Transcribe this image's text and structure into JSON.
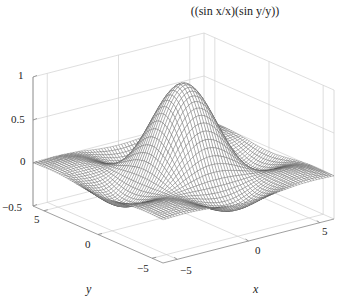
{
  "chart_data": {
    "type": "surface3d",
    "title": "((sin x/x)(sin y/y))",
    "function": "z = (sin x / x) * (sin y / y)",
    "xlabel": "x",
    "ylabel": "y",
    "zlabel": "",
    "xlim": [
      -6,
      6
    ],
    "ylim": [
      -6,
      6
    ],
    "zlim": [
      -0.5,
      1
    ],
    "x_ticks": [
      "-5",
      "0",
      "5"
    ],
    "y_ticks": [
      "5",
      "0",
      "-5"
    ],
    "z_ticks": [
      "1",
      "0.5",
      "0",
      "-0.5"
    ],
    "grid": true,
    "style": "mesh",
    "peak": {
      "x": 0,
      "y": 0,
      "z": 1
    },
    "colors": {
      "mesh": "#555555",
      "grid": "#d0d0d0",
      "axis": "#888888"
    }
  },
  "labels": {
    "title": "((sin x/x)(sin y/y))",
    "x_axis": "x",
    "y_axis": "y",
    "z_ticks": [
      "1",
      "0.5",
      "0",
      "−0.5"
    ],
    "y_ticks": [
      "5",
      "0",
      "−5"
    ],
    "x_ticks": [
      "−5",
      "0",
      "5"
    ]
  }
}
